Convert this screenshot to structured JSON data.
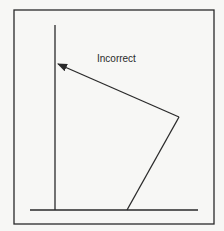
{
  "diagram": {
    "label": "Incorrect",
    "colors": {
      "background": "#f7f7f5",
      "stroke": "#2a2a2a"
    },
    "frame": {
      "x": 14,
      "y": 10,
      "width": 200,
      "height": 214
    },
    "vertical_line": {
      "x": 55,
      "y1": 25,
      "y2": 210
    },
    "baseline": {
      "x1": 30,
      "x2": 198,
      "y": 210
    },
    "bent_arrow": {
      "start": [
        127,
        210
      ],
      "elbow": [
        179,
        117
      ],
      "tip": [
        57,
        64
      ]
    },
    "label_position": [
      97,
      62
    ]
  }
}
